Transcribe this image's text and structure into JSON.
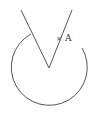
{
  "diagram": {
    "colors": {
      "stroke": "#555555",
      "label": "#333333",
      "background": "#ffffff"
    },
    "circle": {
      "center": [
        49,
        68
      ],
      "radius": 38,
      "arc_start": [
        31,
        34
      ],
      "arc_end": [
        82,
        48
      ]
    },
    "lines": [
      {
        "name": "left-ray",
        "from": [
          21,
          10
        ],
        "to": [
          49,
          68
        ]
      },
      {
        "name": "right-ray",
        "from": [
          49,
          68
        ],
        "to": [
          72,
          10
        ]
      }
    ],
    "point": {
      "marker": "×",
      "label": "A",
      "position": [
        59,
        38
      ]
    }
  }
}
